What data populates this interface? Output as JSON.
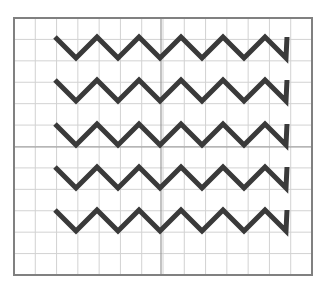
{
  "figure": {
    "title": "",
    "background_color": "#ffffff",
    "width": 326,
    "height": 298
  },
  "chart_data": {
    "type": "line",
    "title": "",
    "subtitle": "",
    "xlabel": "",
    "ylabel": "",
    "xlim": [
      0,
      14
    ],
    "ylim": [
      0,
      12
    ],
    "grid": true,
    "legend_position": "none",
    "tick_labels": {
      "x": [],
      "y": []
    },
    "annotations": [],
    "series": [
      {
        "name": "zigzag-row-1",
        "color": "#3a3a3a",
        "linewidth": 5,
        "x": [
          1.95,
          2.95,
          3.95,
          4.95,
          5.95,
          6.95,
          7.95,
          8.95,
          9.95,
          10.95,
          11.95,
          12.95
        ],
        "y": [
          9.1,
          8.15,
          9.1,
          8.15,
          9.1,
          8.15,
          9.1,
          8.15,
          9.1,
          8.15,
          9.1,
          9.1
        ]
      },
      {
        "name": "zigzag-row-2",
        "color": "#3a3a3a",
        "linewidth": 5,
        "x": [
          1.95,
          2.95,
          3.95,
          4.95,
          5.95,
          6.95,
          7.95,
          8.95,
          9.95,
          10.95,
          11.95,
          12.95
        ],
        "y": [
          7.05,
          6.1,
          7.05,
          6.1,
          7.05,
          6.1,
          7.05,
          6.1,
          7.05,
          6.1,
          7.05,
          7.05
        ]
      },
      {
        "name": "zigzag-row-3",
        "color": "#3a3a3a",
        "linewidth": 5,
        "x": [
          1.95,
          2.95,
          3.95,
          4.95,
          5.95,
          6.95,
          7.95,
          8.95,
          9.95,
          10.95,
          11.95,
          12.95
        ],
        "y": [
          5.0,
          4.05,
          5.0,
          4.05,
          5.0,
          4.05,
          5.0,
          4.05,
          5.0,
          4.05,
          5.0,
          5.0
        ]
      },
      {
        "name": "zigzag-row-4",
        "color": "#3a3a3a",
        "linewidth": 5,
        "x": [
          1.95,
          2.95,
          3.95,
          4.95,
          5.95,
          6.95,
          7.95,
          8.95,
          9.95,
          10.95,
          11.95,
          12.95
        ],
        "y": [
          2.95,
          2.0,
          2.95,
          2.0,
          2.95,
          2.0,
          2.95,
          2.0,
          2.95,
          2.0,
          2.95,
          2.95
        ]
      },
      {
        "name": "zigzag-row-5",
        "color": "#3a3a3a",
        "linewidth": 5,
        "x": [
          1.95,
          2.95,
          3.95,
          4.95,
          5.95,
          6.95,
          7.95,
          8.95,
          9.95,
          10.95,
          11.95,
          12.95
        ],
        "y": [
          0.9,
          -0.05,
          0.9,
          -0.05,
          0.9,
          -0.05,
          0.9,
          -0.05,
          0.9,
          -0.05,
          0.9,
          0.9
        ]
      }
    ],
    "geometry": {
      "plot_box": {
        "x": 14,
        "y": 18,
        "width": 298,
        "height": 257
      },
      "grid_cell": {
        "width": 21.29,
        "height": 21.42
      },
      "grid_columns": 14,
      "grid_rows": 12,
      "major_gridline_x": 161,
      "major_gridline_y": 147,
      "zigzag_rows": 5,
      "zigzag_peak_y": [
        37,
        80,
        124,
        167,
        210
      ],
      "zigzag_valley_y": [
        58,
        101,
        145,
        188,
        231
      ],
      "zigzag_peak_x": [
        55,
        97,
        139,
        182,
        224,
        266
      ],
      "zigzag_valley_x": [
        76,
        118,
        161,
        203,
        245
      ],
      "zigzag_end_x": 287,
      "zigzag_start_x": 55,
      "zigzag_amplitude": 21,
      "zigzag_half_period": 21
    }
  },
  "style": {
    "border_color": "#808080",
    "border_width": 2,
    "grid_minor_color": "#d2d2d2",
    "grid_major_color": "#9a9a9a",
    "line_color": "#3a3a3a",
    "line_width": 5,
    "background_color": "#ffffff"
  }
}
